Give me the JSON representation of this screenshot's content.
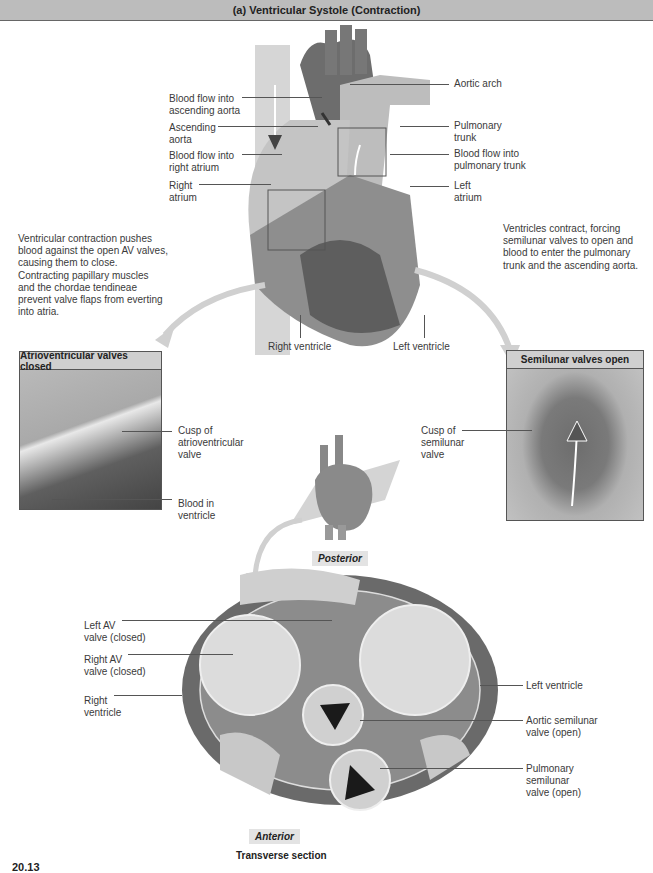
{
  "header": {
    "title": "(a) Ventricular Systole (Contraction)"
  },
  "heart_labels": {
    "left": [
      {
        "text": "Blood flow into\nascending aorta"
      },
      {
        "text": "Ascending\naorta"
      },
      {
        "text": "Blood flow into\nright atrium"
      },
      {
        "text": "Right\natrium"
      }
    ],
    "right": [
      {
        "text": "Aortic arch"
      },
      {
        "text": "Pulmonary\ntrunk"
      },
      {
        "text": "Blood flow into\npulmonary trunk"
      },
      {
        "text": "Left\natrium"
      }
    ],
    "bottom": [
      {
        "text": "Right ventricle"
      },
      {
        "text": "Left ventricle"
      }
    ]
  },
  "descriptions": {
    "left": "Ventricular contraction pushes blood against the open AV valves, causing them to close. Contracting papillary muscles and the chordae tendineae prevent valve flaps from everting into atria.",
    "right": "Ventricles contract, forcing semilunar valves to open and blood to enter the pulmonary trunk and the ascending aorta."
  },
  "insets": {
    "av": {
      "title": "Atrioventricular valves closed",
      "labels": [
        {
          "text": "Cusp of\natrioventricular\nvalve"
        },
        {
          "text": "Blood in\nventricle"
        }
      ]
    },
    "semilunar": {
      "title": "Semilunar valves open",
      "labels": [
        {
          "text": "Cusp of\nsemilunar\nvalve"
        }
      ]
    }
  },
  "section": {
    "posterior": "Posterior",
    "anterior": "Anterior",
    "caption": "Transverse section",
    "left_labels": [
      {
        "text": "Left AV\nvalve (closed)"
      },
      {
        "text": "Right AV\nvalve (closed)"
      },
      {
        "text": "Right\nventricle"
      }
    ],
    "right_labels": [
      {
        "text": "Left ventricle"
      },
      {
        "text": "Aortic semilunar\nvalve (open)"
      },
      {
        "text": "Pulmonary\nsemilunar\nvalve (open)"
      }
    ]
  },
  "figure_number": "20.13"
}
